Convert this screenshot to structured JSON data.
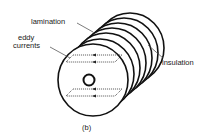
{
  "figure": {
    "caption": "(b)",
    "labels": {
      "lamination": "lamination",
      "eddy_currents_line1": "eddy",
      "eddy_currents_line2": "currents",
      "insulation": "insulation"
    },
    "lamination_count": 7,
    "colors": {
      "stroke": "#111111",
      "label_text": "#1a1a1a",
      "leader": "#444444",
      "background": "#ffffff"
    }
  }
}
